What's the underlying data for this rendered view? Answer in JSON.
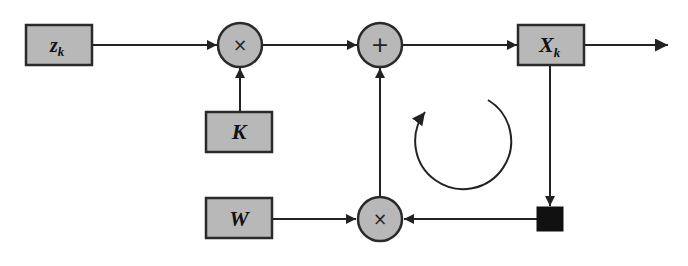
{
  "diagram": {
    "type": "block-diagram",
    "blocks": {
      "z": {
        "main": "z",
        "sub": "k"
      },
      "K": {
        "main": "K"
      },
      "W": {
        "main": "W"
      },
      "X": {
        "main": "X",
        "sub": "k"
      }
    },
    "operators": {
      "mult_top": "×",
      "sum": "+",
      "mult_bottom": "×"
    },
    "connections": [
      {
        "from": "z_k",
        "to": "mult_top"
      },
      {
        "from": "K",
        "to": "mult_top"
      },
      {
        "from": "mult_top",
        "to": "sum"
      },
      {
        "from": "sum",
        "to": "X_k"
      },
      {
        "from": "X_k",
        "to": "output"
      },
      {
        "from": "X_k",
        "to": "delay"
      },
      {
        "from": "delay",
        "to": "mult_bottom"
      },
      {
        "from": "W",
        "to": "mult_bottom"
      },
      {
        "from": "mult_bottom",
        "to": "sum"
      }
    ],
    "colors": {
      "block_fill": "#b8b8b8",
      "stroke": "#2a2a2a",
      "delay_fill": "#111111"
    }
  }
}
